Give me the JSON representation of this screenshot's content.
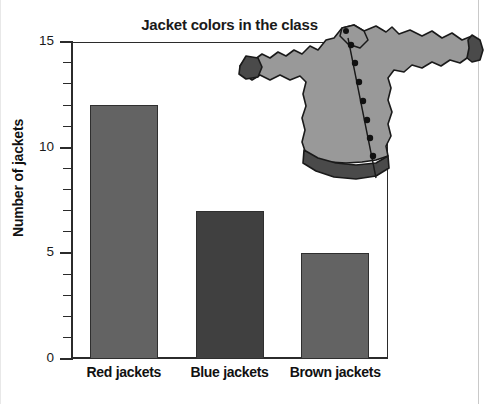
{
  "chart_data": {
    "type": "bar",
    "title": "Jacket colors in the class",
    "xlabel": "",
    "ylabel": "Number of jackets",
    "categories": [
      "Red jackets",
      "Blue jackets",
      "Brown jackets"
    ],
    "values": [
      12,
      7,
      5
    ],
    "ylim": [
      0,
      15
    ],
    "y_major_ticks": [
      0,
      5,
      10,
      15
    ],
    "y_major_tick_labels": [
      "0",
      "5",
      "10",
      "15"
    ],
    "y_minor_tick_interval": 1,
    "grid": false,
    "legend": null,
    "bar_colors": [
      "#636363",
      "#404040",
      "#636363"
    ],
    "series": [
      {
        "name": "Number of jackets",
        "values": [
          12,
          7,
          5
        ]
      }
    ]
  },
  "illustration": {
    "name": "jacket-illustration",
    "description": "gray button-up jacket",
    "body_color": "#999999",
    "trim_color": "#4a4a4a",
    "button_color": "#111111",
    "outline_color": "#1a1a1a",
    "button_count": 8
  },
  "axes": {
    "axis_color": "#2b2b2b",
    "text_color": "#111111"
  }
}
